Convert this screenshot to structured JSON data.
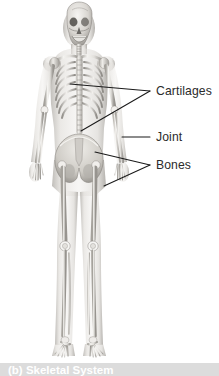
{
  "figure": {
    "type": "anatomical-illustration",
    "style": "grayscale photographic rendering of a full skeleton inside a translucent body silhouette",
    "background_color": "#ffffff",
    "label_color": "#2b2b2b",
    "leader_line_color": "#1a1a1a",
    "bone_light": "#f2f1ee",
    "bone_mid": "#c9c6c0",
    "bone_shadow": "#8e8b86",
    "body_silhouette": "#b9b6b1"
  },
  "labels": [
    {
      "id": "cartilages",
      "text": "Cartilages",
      "text_x": 156,
      "text_y": 95,
      "leaders": [
        {
          "x1": 150,
          "y1": 91,
          "x2": 70,
          "y2": 84
        },
        {
          "x1": 150,
          "y1": 91,
          "x2": 81,
          "y2": 131
        }
      ]
    },
    {
      "id": "joint",
      "text": "Joint",
      "text_x": 156,
      "text_y": 141,
      "leaders": [
        {
          "x1": 150,
          "y1": 137,
          "x2": 122,
          "y2": 137
        }
      ]
    },
    {
      "id": "bones",
      "text": "Bones",
      "text_x": 156,
      "text_y": 169,
      "leaders": [
        {
          "x1": 150,
          "y1": 165,
          "x2": 95,
          "y2": 152
        },
        {
          "x1": 150,
          "y1": 165,
          "x2": 104,
          "y2": 186
        }
      ]
    }
  ],
  "caption": {
    "text": "(b) Skeletal System",
    "band_color": "#dcdcdc",
    "text_color": "#ffffff"
  }
}
